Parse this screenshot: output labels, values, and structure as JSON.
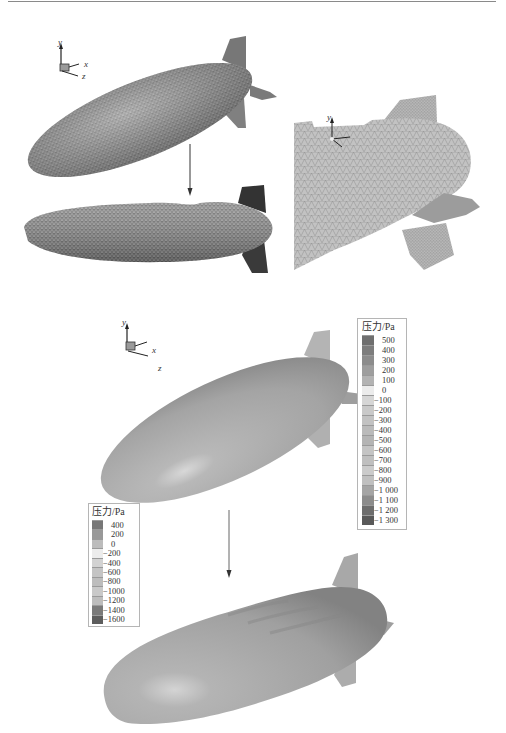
{
  "figure": {
    "panels": [
      {
        "id": "a",
        "description": "Initial triangular surface mesh of airship (isometric view)"
      },
      {
        "id": "b",
        "description": "Deformed triangular surface mesh after structural response"
      },
      {
        "id": "c",
        "description": "Close-up of tail mesh with fins"
      },
      {
        "id": "d",
        "description": "Pressure contour on initial airship shape"
      },
      {
        "id": "e",
        "description": "Pressure contour on deformed airship shape"
      }
    ],
    "axes_triad": {
      "x": "x",
      "y": "y",
      "z": "z"
    }
  },
  "chart_data": [
    {
      "type": "heatmap",
      "title": "压力/Pa",
      "legend_position": "right",
      "levels": [
        500,
        400,
        300,
        200,
        100,
        0,
        -100,
        -200,
        -300,
        -400,
        -500,
        -600,
        -700,
        -800,
        -900,
        -1000,
        -1100,
        -1200,
        -1300
      ],
      "tick_labels": [
        "500",
        "400",
        "300",
        "200",
        "100",
        "0",
        "−100",
        "−200",
        "−300",
        "−400",
        "−500",
        "−600",
        "−700",
        "−800",
        "−900",
        "−1 000",
        "−1 100",
        "−1 200",
        "−1 300"
      ],
      "colors": [
        "#6f6f6f",
        "#7d7d7d",
        "#8c8c8c",
        "#9e9e9e",
        "#b3b3b3",
        "#ececec",
        "#d6d6d6",
        "#c9c9c9",
        "#c2c2c2",
        "#bababa",
        "#b4b4b4",
        "#c4c4c4",
        "#bfbfbf",
        "#cbcbcb",
        "#c0c0c0",
        "#a5a5a5",
        "#8c8c8c",
        "#6d6d6d",
        "#595959"
      ],
      "range": [
        -1300,
        500
      ],
      "unit": "Pa"
    },
    {
      "type": "heatmap",
      "title": "压力/Pa",
      "legend_position": "left",
      "levels": [
        400,
        200,
        0,
        -200,
        -400,
        -600,
        -800,
        -1000,
        -1200,
        -1400,
        -1600
      ],
      "tick_labels": [
        "400",
        "200",
        "0",
        "−200",
        "−400",
        "−600",
        "−800",
        "−1000",
        "−1200",
        "−1400",
        "−1600"
      ],
      "colors": [
        "#777777",
        "#999999",
        "#bcbcbc",
        "#ececec",
        "#d2d2d2",
        "#c4c4c4",
        "#bdbdbd",
        "#c9c9c9",
        "#bdbdbd",
        "#7a7a7a",
        "#5d5d5d"
      ],
      "range": [
        -1600,
        400
      ],
      "unit": "Pa"
    }
  ]
}
